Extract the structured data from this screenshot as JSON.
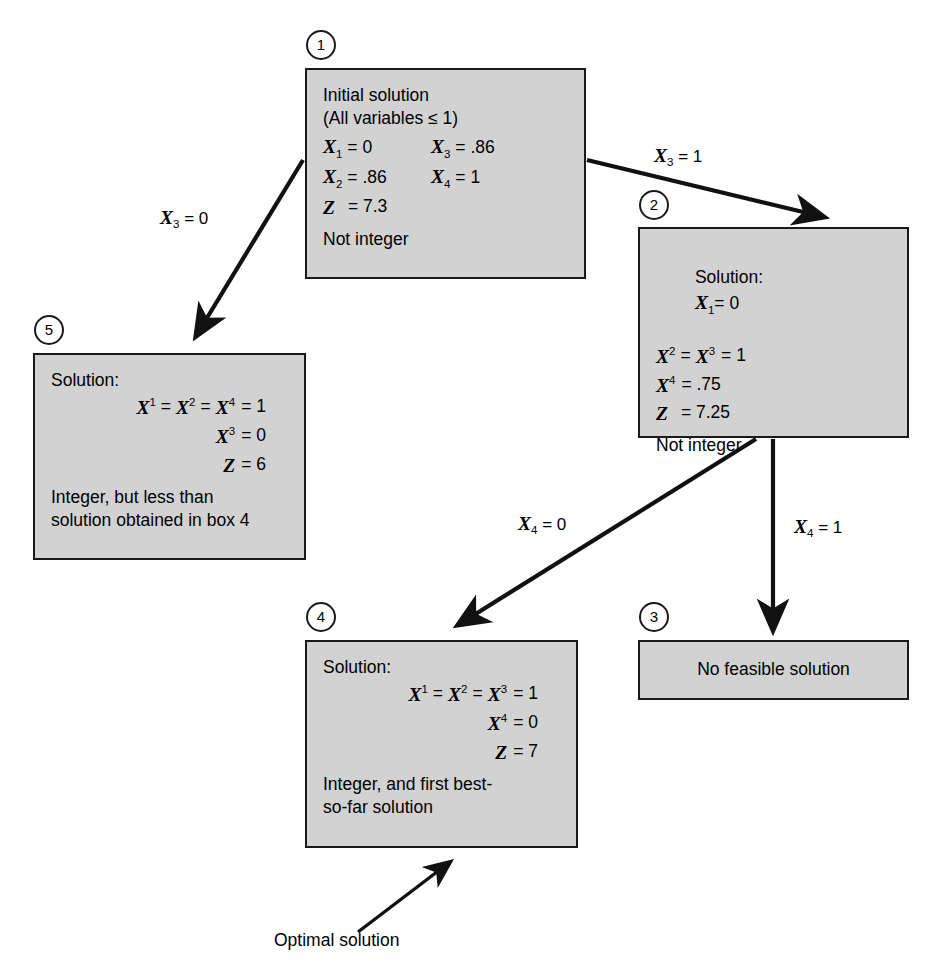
{
  "diagram": {
    "box_fill": "#d2d2d2",
    "box_border": "#1a1a1a",
    "background": "#ffffff"
  },
  "nodes": [
    {
      "id": "node1",
      "badge": "1",
      "header1": "Initial solution",
      "header2": "(All variables ≤ 1)",
      "rows": [
        {
          "left_var": "X",
          "left_sub": "1",
          "left_val": "= 0",
          "right_var": "X",
          "right_sub": "3",
          "right_val": "= .86"
        },
        {
          "left_var": "X",
          "left_sub": "2",
          "left_val": "= .86",
          "right_var": "X",
          "right_sub": "4",
          "right_val": "= 1"
        }
      ],
      "z_var": "Z",
      "z_val": "= 7.3",
      "footer": "Not integer"
    },
    {
      "id": "node2",
      "badge": "2",
      "header1": "Solution:",
      "header1_var": "X",
      "header1_sub": "1",
      "header1_val": "= 0",
      "rows": [
        {
          "text_var1": "X",
          "text_sub1": "2",
          "eq1": "=",
          "text_var2": "X",
          "text_sub2": "3",
          "eq2": "= 1"
        },
        {
          "text_var1": "X",
          "text_sub1": "4",
          "eq1": "= .75"
        }
      ],
      "z_var": "Z",
      "z_val": "= 7.25",
      "footer": "Not integer"
    },
    {
      "id": "node3",
      "badge": "3",
      "text": "No feasible solution"
    },
    {
      "id": "node4",
      "badge": "4",
      "header1": "Solution:",
      "line_chain": [
        {
          "var": "X",
          "sub": "1"
        },
        {
          "var": "X",
          "sub": "2"
        },
        {
          "var": "X",
          "sub": "3"
        }
      ],
      "chain_val": "= 1",
      "x4_var": "X",
      "x4_sub": "4",
      "x4_val": "= 0",
      "z_var": "Z",
      "z_val": "= 7",
      "footer_line1": "Integer, and first best-",
      "footer_line2": "so-far solution"
    },
    {
      "id": "node5",
      "badge": "5",
      "header1": "Solution:",
      "line_chain": [
        {
          "var": "X",
          "sub": "1"
        },
        {
          "var": "X",
          "sub": "2"
        },
        {
          "var": "X",
          "sub": "4"
        }
      ],
      "chain_val": "= 1",
      "x3_var": "X",
      "x3_sub": "3",
      "x3_val": "= 0",
      "z_var": "Z",
      "z_val": "= 6",
      "footer_line1": "Integer, but less than",
      "footer_line2": "solution obtained in box 4"
    }
  ],
  "edges": [
    {
      "id": "edge-1-to-5",
      "var": "X",
      "sub": "3",
      "val": "= 0"
    },
    {
      "id": "edge-1-to-2",
      "var": "X",
      "sub": "3",
      "val": "= 1"
    },
    {
      "id": "edge-2-to-4",
      "var": "X",
      "sub": "4",
      "val": "= 0"
    },
    {
      "id": "edge-2-to-3",
      "var": "X",
      "sub": "4",
      "val": "= 1"
    }
  ],
  "annotations": {
    "optimal_solution": "Optimal solution"
  }
}
